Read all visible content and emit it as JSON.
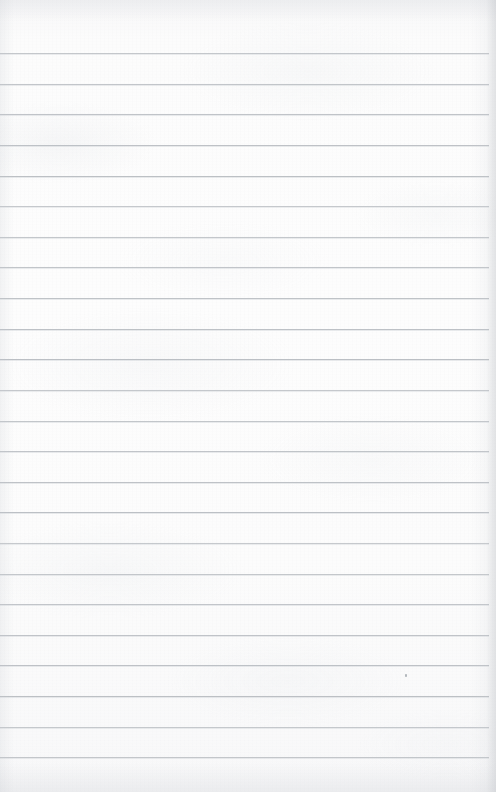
{
  "page": {
    "kind": "scanned-blank-lined-notebook-paper",
    "width": 496,
    "height": 792,
    "paper_color": "#fdfdfd",
    "paper_shadow_color": "#f4f4f5",
    "text_content": "",
    "handwriting": "",
    "printed_text": "",
    "title": "",
    "header": "",
    "footer": "",
    "page_number": ""
  },
  "ruling": {
    "line_color": "#b9bdc2",
    "line_thickness_px": 1,
    "line_spacing_px": 30.6,
    "first_line_y": 53,
    "line_count": 24,
    "line_left_x": 0,
    "line_right_x": 489,
    "margin_rule": "none",
    "top_margin_px": 53,
    "bottom_margin_px": 36,
    "lines": [
      {
        "index": 1,
        "y": 53,
        "left": 0,
        "right": 489
      },
      {
        "index": 2,
        "y": 84,
        "left": 0,
        "right": 489
      },
      {
        "index": 3,
        "y": 114,
        "left": 0,
        "right": 489
      },
      {
        "index": 4,
        "y": 145,
        "left": 0,
        "right": 489
      },
      {
        "index": 5,
        "y": 176,
        "left": 0,
        "right": 489
      },
      {
        "index": 6,
        "y": 206,
        "left": 0,
        "right": 489
      },
      {
        "index": 7,
        "y": 237,
        "left": 0,
        "right": 489
      },
      {
        "index": 8,
        "y": 267,
        "left": 0,
        "right": 489
      },
      {
        "index": 9,
        "y": 298,
        "left": 0,
        "right": 489
      },
      {
        "index": 10,
        "y": 329,
        "left": 0,
        "right": 489
      },
      {
        "index": 11,
        "y": 359,
        "left": 0,
        "right": 489
      },
      {
        "index": 12,
        "y": 390,
        "left": 0,
        "right": 489
      },
      {
        "index": 13,
        "y": 421,
        "left": 0,
        "right": 489
      },
      {
        "index": 14,
        "y": 451,
        "left": 0,
        "right": 489
      },
      {
        "index": 15,
        "y": 482,
        "left": 0,
        "right": 489
      },
      {
        "index": 16,
        "y": 512,
        "left": 0,
        "right": 489
      },
      {
        "index": 17,
        "y": 543,
        "left": 0,
        "right": 489
      },
      {
        "index": 18,
        "y": 574,
        "left": 0,
        "right": 489
      },
      {
        "index": 19,
        "y": 604,
        "left": 0,
        "right": 489
      },
      {
        "index": 20,
        "y": 635,
        "left": 0,
        "right": 489
      },
      {
        "index": 21,
        "y": 665,
        "left": 0,
        "right": 489
      },
      {
        "index": 22,
        "y": 696,
        "left": 0,
        "right": 489
      },
      {
        "index": 23,
        "y": 727,
        "left": 0,
        "right": 489
      },
      {
        "index": 24,
        "y": 757,
        "left": 0,
        "right": 489
      }
    ]
  },
  "artifacts": {
    "specks": [
      {
        "x": 405,
        "y": 674,
        "w": 2,
        "h": 3,
        "color": "#9aa0a7"
      }
    ],
    "right_edge_shadow": true,
    "bottom_edge_shadow": true,
    "top_edge_shadow": true,
    "left_edge_shadow": true
  }
}
